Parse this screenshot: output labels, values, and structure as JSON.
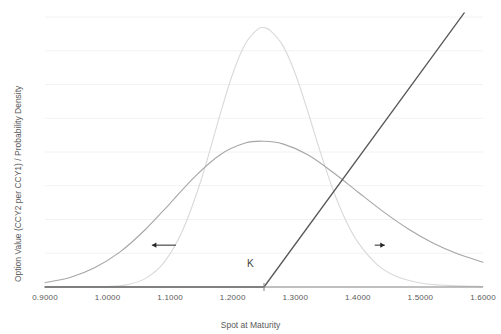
{
  "chart_data": {
    "type": "line",
    "title": "",
    "xlabel": "Spot at Maturity",
    "ylabel": "Option Value (CCY2 per CCY1) / Probability Density",
    "xlim": [
      0.9,
      1.6
    ],
    "ylim": [
      0,
      1.0
    ],
    "grid": true,
    "gridlines_count": 8,
    "legend_position": "none",
    "x_ticks": [
      "0.9000",
      "1.0000",
      "1.1000",
      "1.2000",
      "1.3000",
      "1.4000",
      "1.5000",
      "1.6000"
    ],
    "x_tick_values": [
      0.9,
      1.0,
      1.1,
      1.2,
      1.3,
      1.4,
      1.5,
      1.6
    ],
    "y_ticks": [],
    "annotations": [
      {
        "name": "strike-label",
        "text": "K",
        "x": 1.25,
        "y": 0.1
      },
      {
        "name": "left-tail-arrow",
        "text": "",
        "x": 1.09,
        "y": 0.155,
        "direction": "left"
      },
      {
        "name": "right-tail-arrow",
        "text": "",
        "x": 1.435,
        "y": 0.155,
        "direction": "right"
      }
    ],
    "series": [
      {
        "name": "narrow-density",
        "type": "line",
        "color": "#d9d9d9",
        "x": [
          0.9,
          0.95,
          1.0,
          1.03,
          1.06,
          1.09,
          1.12,
          1.15,
          1.18,
          1.2,
          1.22,
          1.24,
          1.25,
          1.26,
          1.28,
          1.3,
          1.32,
          1.34,
          1.36,
          1.38,
          1.4,
          1.43,
          1.46,
          1.5,
          1.54,
          1.6
        ],
        "y": [
          0.0,
          0.0,
          0.002,
          0.008,
          0.031,
          0.09,
          0.21,
          0.4,
          0.64,
          0.79,
          0.9,
          0.955,
          0.96,
          0.95,
          0.895,
          0.79,
          0.65,
          0.5,
          0.362,
          0.25,
          0.166,
          0.085,
          0.041,
          0.015,
          0.006,
          0.002
        ]
      },
      {
        "name": "wide-density",
        "type": "line",
        "color": "#a6a6a6",
        "x": [
          0.9,
          0.94,
          0.98,
          1.02,
          1.06,
          1.1,
          1.14,
          1.18,
          1.22,
          1.25,
          1.28,
          1.32,
          1.36,
          1.4,
          1.44,
          1.48,
          1.52,
          1.56,
          1.6
        ],
        "y": [
          0.016,
          0.035,
          0.072,
          0.13,
          0.212,
          0.31,
          0.41,
          0.49,
          0.533,
          0.54,
          0.53,
          0.49,
          0.425,
          0.352,
          0.28,
          0.216,
          0.163,
          0.122,
          0.092
        ]
      },
      {
        "name": "call-payoff",
        "type": "line",
        "color": "#595959",
        "x": [
          0.9,
          1.25,
          1.57
        ],
        "y": [
          0.0,
          0.0,
          1.015
        ]
      }
    ]
  },
  "axis": {
    "x_title": "Spot at Maturity",
    "y_title": "Option Value (CCY2 per CCY1) / Probability Density"
  },
  "colors": {
    "gridline": "#f2f2f2",
    "axis_line": "#808080",
    "tick_text": "#595959",
    "narrow_density": "#d9d9d9",
    "wide_density": "#a6a6a6",
    "payoff_line": "#595959",
    "annotation": "#262626",
    "background": "#ffffff"
  },
  "strike": {
    "label": "K",
    "value": "1.2500"
  }
}
